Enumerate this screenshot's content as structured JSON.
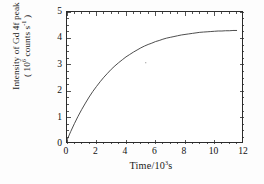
{
  "chart_data": {
    "type": "line",
    "title": "",
    "xlabel": "Time/10³s",
    "ylabel": "Intensity of Gd 4f peak (10⁶ counts s⁻¹)",
    "ylabel_line1": "Intensity of Gd 4f peak",
    "ylabel_line2_prefix": "( 10",
    "ylabel_line2_sup1": "6",
    "ylabel_line2_mid": " counts s",
    "ylabel_line2_sup2": "-1",
    "ylabel_line2_suffix": " )",
    "xlabel_prefix": "Time/10",
    "xlabel_sup": "3",
    "xlabel_suffix": "s",
    "xlim": [
      0,
      12
    ],
    "ylim": [
      0,
      5
    ],
    "x_major_ticks": [
      0,
      2,
      4,
      6,
      8,
      10,
      12
    ],
    "y_major_ticks": [
      0,
      1,
      2,
      3,
      4,
      5
    ],
    "x_minor_interval": 0.5,
    "y_minor_interval": 0.25,
    "x_tick_labels": [
      "0",
      "2",
      "4",
      "6",
      "8",
      "10",
      "12"
    ],
    "y_tick_labels": [
      "0",
      "1",
      "2",
      "3",
      "4",
      "5"
    ],
    "grid": false,
    "legend": false,
    "tick_direction": "in",
    "frame": "box",
    "line_color": "#3a3a3a",
    "line_width": 0.9,
    "series": [
      {
        "name": "Gd 4f peak intensity",
        "model": "saturating exponential",
        "x": [
          0.0,
          0.25,
          0.5,
          0.75,
          1.0,
          1.25,
          1.5,
          1.75,
          2.0,
          2.25,
          2.5,
          2.75,
          3.0,
          3.25,
          3.5,
          3.75,
          4.0,
          4.25,
          4.5,
          4.75,
          5.0,
          5.25,
          5.5,
          5.75,
          6.0,
          6.25,
          6.5,
          6.75,
          7.0,
          7.25,
          7.5,
          7.75,
          8.0,
          8.25,
          8.5,
          8.75,
          9.0,
          9.25,
          9.5,
          9.75,
          10.0,
          10.25,
          10.5,
          10.75,
          11.0,
          11.25,
          11.5
        ],
        "y": [
          0.15,
          0.47,
          0.77,
          1.05,
          1.31,
          1.55,
          1.78,
          1.99,
          2.18,
          2.36,
          2.53,
          2.68,
          2.83,
          2.96,
          3.08,
          3.19,
          3.3,
          3.39,
          3.48,
          3.56,
          3.64,
          3.71,
          3.77,
          3.82,
          3.88,
          3.92,
          3.97,
          4.01,
          4.04,
          4.07,
          4.1,
          4.13,
          4.15,
          4.17,
          4.19,
          4.21,
          4.23,
          4.24,
          4.25,
          4.26,
          4.27,
          4.28,
          4.28,
          4.29,
          4.29,
          4.3,
          4.3
        ],
        "plateau": 4.3,
        "start_value": 0.15,
        "x_start": 0.0,
        "x_end": 11.5
      }
    ],
    "annotations": [
      {
        "name": "speck",
        "x": 5.3,
        "y": 3.1
      }
    ]
  }
}
